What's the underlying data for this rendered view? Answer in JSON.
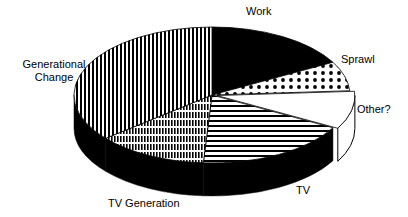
{
  "chart_data": {
    "type": "pie",
    "style": "3d-exploded",
    "title": "",
    "slices": [
      {
        "label": "Work",
        "value": 17,
        "pattern": "solid-black"
      },
      {
        "label": "Sprawl",
        "value": 7,
        "pattern": "dots"
      },
      {
        "label": "Other?",
        "value": 9,
        "pattern": "white",
        "exploded": true
      },
      {
        "label": "TV",
        "value": 18,
        "pattern": "horizontal-stripes"
      },
      {
        "label": "TV Generation",
        "value": 13,
        "pattern": "vertical-and-horizontal-stripes"
      },
      {
        "label": "Generational Change",
        "value": 36,
        "pattern": "vertical-stripes"
      }
    ],
    "legend": "none (direct labels)"
  },
  "labels": {
    "work": "Work",
    "sprawl": "Sprawl",
    "other": "Other?",
    "tv": "TV",
    "tv_generation": "TV Generation",
    "gen_change_1": "Generational",
    "gen_change_2": "Change"
  }
}
